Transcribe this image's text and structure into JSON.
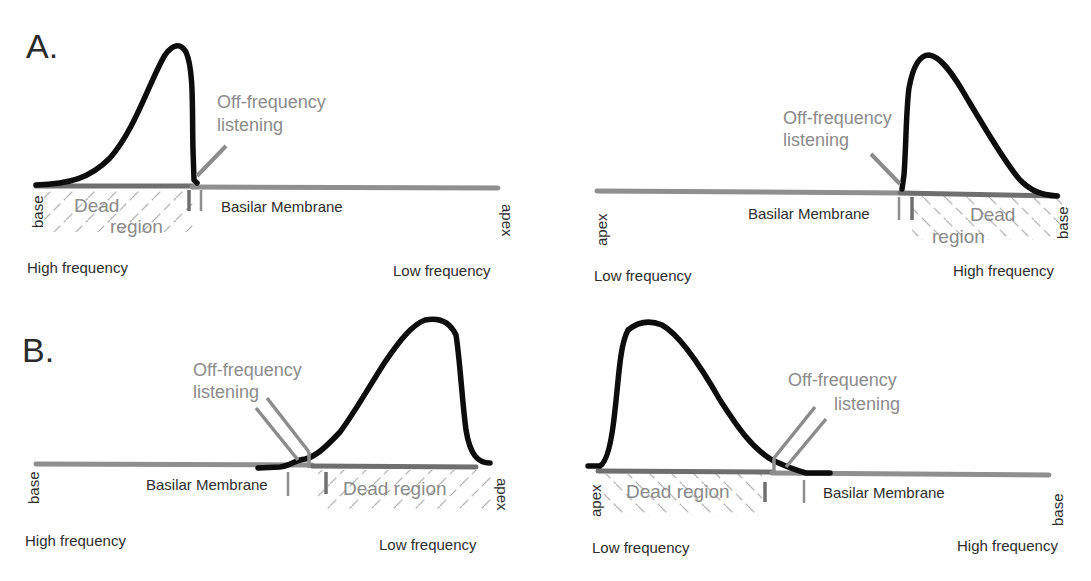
{
  "figure": {
    "colors": {
      "curve": "#0d0d0d",
      "membrane": "#8f8f8f",
      "membrane_dead": "#6f6f6f",
      "annotation": "#8c8c8c",
      "hatch": "#b5b5b5",
      "text": "#2e2e2e"
    },
    "panels": [
      {
        "id": "A-left",
        "label": "A.",
        "membrane_label": "Basilar Membrane",
        "ofl_label_line1": "Off-frequency",
        "ofl_label_line2": "listening",
        "dead_line1": "Dead",
        "dead_line2": "region",
        "left_end": "base",
        "right_end": "apex",
        "left_freq": "High frequency",
        "right_freq": "Low frequency"
      },
      {
        "id": "A-right",
        "label": "",
        "membrane_label": "Basilar Membrane",
        "ofl_label_line1": "Off-frequency",
        "ofl_label_line2": "listening",
        "dead_line1": "Dead",
        "dead_line2": "region",
        "left_end": "apex",
        "right_end": "base",
        "left_freq": "Low frequency",
        "right_freq": "High frequency"
      },
      {
        "id": "B-left",
        "label": "B.",
        "membrane_label": "Basilar Membrane",
        "ofl_label_line1": "Off-frequency",
        "ofl_label_line2": "listening",
        "dead_line1": "Dead region",
        "left_end": "base",
        "right_end": "apex",
        "left_freq": "High frequency",
        "right_freq": "Low frequency"
      },
      {
        "id": "B-right",
        "label": "",
        "membrane_label": "Basilar Membrane",
        "ofl_label_line1": "Off-frequency",
        "ofl_label_line2": "listening",
        "dead_line1": "Dead region",
        "left_end": "apex",
        "right_end": "base",
        "left_freq": "Low frequency",
        "right_freq": "High frequency"
      }
    ]
  }
}
